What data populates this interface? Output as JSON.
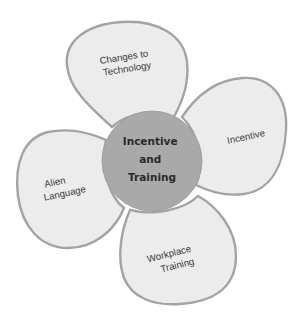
{
  "diagram": {
    "type": "flower-diagram",
    "center": {
      "lines": [
        "Incentive",
        "and",
        "Training"
      ],
      "fill": "#a9a9a9"
    },
    "petals": [
      {
        "position": "top",
        "lines": [
          "Changes to",
          "Technology"
        ]
      },
      {
        "position": "right",
        "lines": [
          "Incentive"
        ]
      },
      {
        "position": "left",
        "lines": [
          "Alien",
          "Language"
        ]
      },
      {
        "position": "bottom",
        "lines": [
          "Workplace",
          "Training"
        ]
      }
    ],
    "colors": {
      "petal_fill": "#ececec",
      "petal_stroke": "#a3a3a3",
      "text": "#3a3a3a"
    }
  }
}
